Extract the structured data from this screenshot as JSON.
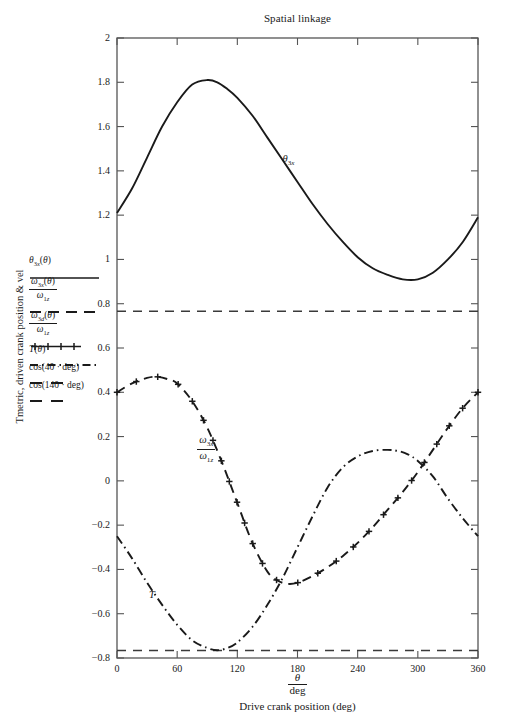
{
  "chart_data": {
    "type": "line",
    "title": "Spatial linkage",
    "xlabel": "Drive crank position (deg)",
    "xlabel_fraction": {
      "num": "θ",
      "den": "deg"
    },
    "ylabel": "Tmetric, driven crank position & vel",
    "xlim": [
      0,
      360
    ],
    "ylim": [
      -0.8,
      2
    ],
    "xticks": [
      0,
      60,
      120,
      180,
      240,
      300,
      360
    ],
    "xtick_labels": [
      "0",
      "60",
      "120",
      "180",
      "240",
      "300",
      "360"
    ],
    "yticks": [
      2,
      1.8,
      1.6,
      1.4,
      1.2,
      1,
      0.8,
      0.6,
      0.4,
      0.2,
      0,
      -0.2,
      -0.4,
      -0.6,
      -0.8
    ],
    "ytick_labels": [
      "2",
      "1.8",
      "1.6",
      "1.4",
      "1.2",
      "1",
      "0.8",
      "0.6",
      "0.4",
      "0.2",
      "0",
      "−0.2",
      "−0.4",
      "−0.6",
      "−0.8"
    ],
    "grid": false,
    "legend_position": "left-outside",
    "series": [
      {
        "name": "theta_3x",
        "legend_num": "θ",
        "legend_sub": "3x",
        "legend_arg": "(θ)",
        "legend_text": "θ₃ₓ(θ)",
        "style": "solid",
        "color": "#1a1a1a",
        "x": [
          0,
          15,
          30,
          45,
          60,
          75,
          90,
          100,
          110,
          120,
          135,
          150,
          165,
          180,
          195,
          210,
          225,
          240,
          255,
          270,
          285,
          300,
          315,
          330,
          345,
          360
        ],
        "y": [
          1.21,
          1.32,
          1.46,
          1.6,
          1.71,
          1.79,
          1.81,
          1.8,
          1.77,
          1.73,
          1.65,
          1.55,
          1.45,
          1.35,
          1.25,
          1.16,
          1.08,
          1.01,
          0.96,
          0.93,
          0.91,
          0.91,
          0.94,
          1.0,
          1.08,
          1.19
        ]
      },
      {
        "name": "omega_3x_over_omega_1z",
        "legend_num": "ω₃ₓ(θ)",
        "legend_den": "ω₁z",
        "legend_text": "ω₃ₓ(θ) / ω₁z",
        "style": "dashed",
        "color": "#1a1a1a",
        "x": [
          0,
          15,
          30,
          40,
          50,
          60,
          75,
          90,
          105,
          120,
          135,
          150,
          160,
          170,
          180,
          195,
          210,
          225,
          240,
          255,
          270,
          285,
          300,
          315,
          330,
          345,
          360
        ],
        "y": [
          0.4,
          0.44,
          0.465,
          0.47,
          0.46,
          0.44,
          0.36,
          0.24,
          0.08,
          -0.1,
          -0.28,
          -0.41,
          -0.45,
          -0.465,
          -0.46,
          -0.43,
          -0.39,
          -0.34,
          -0.28,
          -0.21,
          -0.13,
          -0.05,
          0.04,
          0.14,
          0.24,
          0.33,
          0.4
        ]
      },
      {
        "name": "omega_3d_over_omega_1z",
        "legend_num": "ω₃d(θ)",
        "legend_den": "ω₁z",
        "legend_text": "ω₃d(θ) / ω₁z",
        "style": "marker-plus",
        "color": "#1a1a1a"
      },
      {
        "name": "T",
        "legend_text": "T(θ)",
        "style": "dashdot",
        "color": "#1a1a1a",
        "x": [
          0,
          15,
          30,
          45,
          60,
          75,
          90,
          100,
          110,
          120,
          135,
          150,
          165,
          180,
          195,
          210,
          225,
          240,
          255,
          270,
          280,
          290,
          300,
          315,
          330,
          345,
          360
        ],
        "y": [
          -0.25,
          -0.35,
          -0.46,
          -0.56,
          -0.65,
          -0.72,
          -0.755,
          -0.765,
          -0.755,
          -0.73,
          -0.66,
          -0.56,
          -0.44,
          -0.3,
          -0.16,
          -0.03,
          0.06,
          0.11,
          0.135,
          0.14,
          0.135,
          0.12,
          0.09,
          0.02,
          -0.08,
          -0.17,
          -0.25
        ]
      }
    ],
    "reference_lines": [
      {
        "name": "cos(40 · deg)",
        "legend_text": "cos(40 · deg)",
        "value": 0.766,
        "style": "dashed"
      },
      {
        "name": "cos(140 · deg)",
        "legend_text": "cos(140 · deg)",
        "value": -0.766,
        "style": "dashed"
      }
    ],
    "annotations": [
      {
        "name": "theta-3x-curve-label",
        "text": "θ₃ₓ",
        "x": 165,
        "y": 1.45
      },
      {
        "name": "omega-ratio-curve-label",
        "num": "ω₃ₓ",
        "den": "ω₁z",
        "x": 80,
        "y": 0.18
      },
      {
        "name": "T-curve-label",
        "text": "T",
        "x": 32,
        "y": -0.52
      }
    ]
  },
  "legend": {
    "entries": [
      {
        "label": "θ₃ₓ(θ)",
        "style": "solid"
      },
      {
        "label": "ω₃ₓ(θ)/ω₁z",
        "style": "dashed"
      },
      {
        "label": "ω₃d(θ)/ω₁z",
        "style": "plus"
      },
      {
        "label": "T(θ)",
        "style": "dashdot"
      },
      {
        "label": "cos(40 · deg)",
        "style": "dashed-short"
      },
      {
        "label": "cos(140 · deg)",
        "style": "dashed-short"
      }
    ]
  }
}
